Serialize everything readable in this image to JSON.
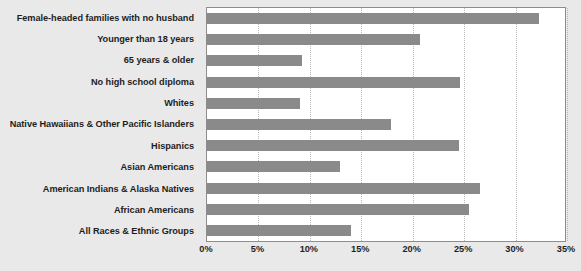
{
  "chart_data": {
    "type": "bar",
    "orientation": "horizontal",
    "title": "",
    "subtitle": "",
    "xlabel": "",
    "ylabel": "",
    "xlim": [
      0,
      35
    ],
    "xtick_step": 5,
    "grid": true,
    "legend": false,
    "bar_color": "#8a8a8a",
    "plot_background": "#ffffff",
    "page_background": "#e9e9e9",
    "axis_unit": "%",
    "categories": [
      "Female-headed families with no husband",
      "Younger than 18 years",
      "65 years & older",
      "No high school diploma",
      "Whites",
      "Native Hawaiians & Other Pacific Islanders",
      "Hispanics",
      "Asian Americans",
      "American Indians & Alaska Natives",
      "African Americans",
      "All Races & Ethnic Groups"
    ],
    "values": [
      32.3,
      20.7,
      9.2,
      24.6,
      9.0,
      17.9,
      24.5,
      12.9,
      26.5,
      25.5,
      14.0
    ],
    "tick_labels": [
      "0%",
      "5%",
      "10%",
      "15%",
      "20%",
      "25%",
      "30%",
      "35%"
    ],
    "tick_values": [
      0,
      5,
      10,
      15,
      20,
      25,
      30,
      35
    ]
  }
}
